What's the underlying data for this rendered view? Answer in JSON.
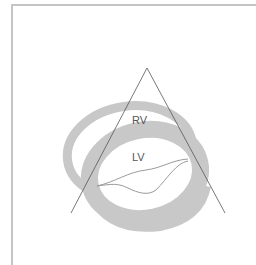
{
  "diagram": {
    "type": "echocardiography-parasternal-view",
    "labels": {
      "rv": "RV",
      "lv": "LV"
    },
    "colors": {
      "myocardium": "#c8c8c8",
      "sector_line": "#555555",
      "valve_line": "#9a9a9a",
      "label_text": "#555555",
      "frame_border": "#c4c4c4",
      "background": "#ffffff"
    },
    "sector": {
      "apex": [
        147,
        68
      ],
      "left_end": [
        71,
        213
      ],
      "right_end": [
        225,
        213
      ]
    }
  }
}
